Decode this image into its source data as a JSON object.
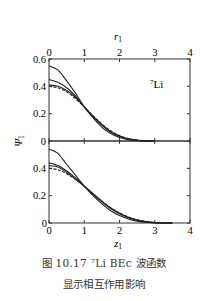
{
  "chart_data": [
    {
      "type": "line",
      "panel": "top",
      "xlabel": "r1",
      "ylabel": "Ψ1",
      "xlim": [
        0,
        4
      ],
      "ylim": [
        0,
        0.6
      ],
      "xticks": [
        "0",
        "1",
        "2",
        "3",
        "4"
      ],
      "yticks": [
        "0",
        "0.2",
        "0.4",
        "0.6"
      ],
      "annotation": "7Li",
      "x": [
        0,
        0.25,
        0.5,
        0.75,
        1.0,
        1.25,
        1.5,
        1.75,
        2.0,
        2.25,
        2.5,
        2.75,
        3.0
      ],
      "series": [
        {
          "name": "curve1",
          "style": "solid",
          "values": [
            0.55,
            0.52,
            0.44,
            0.35,
            0.25,
            0.17,
            0.1,
            0.055,
            0.025,
            0.01,
            0.003,
            0.0,
            0.0
          ]
        },
        {
          "name": "curve2",
          "style": "solid",
          "values": [
            0.45,
            0.43,
            0.39,
            0.33,
            0.25,
            0.18,
            0.115,
            0.065,
            0.033,
            0.014,
            0.005,
            0.001,
            0.0
          ]
        },
        {
          "name": "curve3",
          "style": "solid",
          "values": [
            0.41,
            0.4,
            0.37,
            0.32,
            0.25,
            0.18,
            0.12,
            0.07,
            0.036,
            0.016,
            0.006,
            0.001,
            0.0
          ]
        },
        {
          "name": "curve4",
          "style": "dashed",
          "values": [
            0.4,
            0.39,
            0.36,
            0.31,
            0.25,
            0.185,
            0.125,
            0.075,
            0.04,
            0.018,
            0.007,
            0.002,
            0.0
          ]
        }
      ]
    },
    {
      "type": "line",
      "panel": "bottom",
      "xlabel": "z1",
      "ylabel": "Ψ1",
      "xlim": [
        0,
        4
      ],
      "ylim": [
        0,
        0.6
      ],
      "xticks": [
        "0",
        "1",
        "2",
        "3",
        "4"
      ],
      "yticks": [
        "0",
        "0.2",
        "0.4"
      ],
      "x": [
        0,
        0.25,
        0.5,
        0.75,
        1.0,
        1.25,
        1.5,
        1.75,
        2.0,
        2.25,
        2.5,
        2.75,
        3.0,
        3.25,
        3.5
      ],
      "series": [
        {
          "name": "curve1",
          "style": "solid",
          "values": [
            0.54,
            0.51,
            0.43,
            0.35,
            0.27,
            0.2,
            0.14,
            0.09,
            0.055,
            0.03,
            0.014,
            0.005,
            0.001,
            0.0,
            0.0
          ]
        },
        {
          "name": "curve2",
          "style": "solid",
          "values": [
            0.44,
            0.42,
            0.38,
            0.33,
            0.27,
            0.21,
            0.155,
            0.105,
            0.067,
            0.038,
            0.019,
            0.008,
            0.002,
            0.0,
            0.0
          ]
        },
        {
          "name": "curve3",
          "style": "solid",
          "values": [
            0.42,
            0.41,
            0.37,
            0.32,
            0.27,
            0.215,
            0.16,
            0.11,
            0.072,
            0.042,
            0.022,
            0.01,
            0.003,
            0.001,
            0.0
          ]
        },
        {
          "name": "curve4",
          "style": "dashed",
          "values": [
            0.4,
            0.39,
            0.36,
            0.32,
            0.27,
            0.215,
            0.16,
            0.112,
            0.074,
            0.044,
            0.023,
            0.011,
            0.004,
            0.001,
            0.0
          ]
        }
      ]
    }
  ],
  "labels": {
    "top_xlabel_main": "r",
    "top_xlabel_sub": "1",
    "bottom_xlabel_main": "z",
    "bottom_xlabel_sub": "1",
    "ylabel_main": "Ψ",
    "ylabel_sub": "1",
    "annotation_sup": "7",
    "annotation_main": "Li",
    "corner_zero": "0"
  },
  "caption": {
    "line1": "图 10.17  ⁷Li BEc 波函数",
    "line2": "显示相互作用影响"
  }
}
